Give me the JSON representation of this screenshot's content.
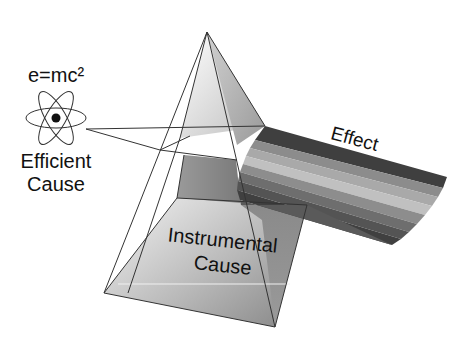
{
  "diagram": {
    "formula": "e=mc²",
    "efficient_cause": {
      "line1": "Efficient",
      "line2": "Cause"
    },
    "instrumental_cause": {
      "line1": "Instrumental",
      "line2": "Cause"
    },
    "effect": "Effect",
    "icons": {
      "atom": "atom-icon",
      "prism": "pyramid-prism"
    },
    "colors": {
      "line": "#333333",
      "beam_bands": [
        "#4a4a4a",
        "#8a8a8a",
        "#b5b5b5",
        "#8f8f8f",
        "#6a6a6a",
        "#4f4f4f",
        "#3e3e3e"
      ]
    }
  }
}
